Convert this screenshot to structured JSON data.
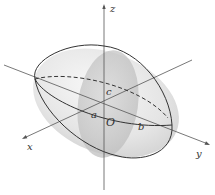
{
  "diagram": {
    "axes": {
      "x": {
        "label": "x"
      },
      "y": {
        "label": "y"
      },
      "z": {
        "label": "z"
      }
    },
    "origin_label": "O",
    "semi_axes": {
      "a": "a",
      "b": "b",
      "c": "c"
    },
    "colors": {
      "ellipsoid_fill": "#e6e6e6",
      "cross_section_fill": "#c8c8c8",
      "outline": "#333333",
      "axis": "#555555"
    }
  }
}
